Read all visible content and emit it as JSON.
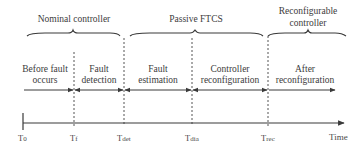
{
  "diagram": {
    "type": "timeline",
    "phases_top": [
      {
        "label": "Nominal controller",
        "from": "T0",
        "to": "Tdet"
      },
      {
        "label": "Passive FTCS",
        "from": "Tdet",
        "to": "Trec"
      },
      {
        "label_line1": "Reconfigurable",
        "label_line2": "controller",
        "from": "Trec",
        "to": "end"
      }
    ],
    "stages": [
      {
        "line1": "Before fault",
        "line2": "occurs"
      },
      {
        "line1": "Fault",
        "line2": "detection"
      },
      {
        "line1": "Fault",
        "line2": "estimation"
      },
      {
        "line1": "Controller",
        "line2": "reconfiguration"
      },
      {
        "line1": "After",
        "line2": "reconfiguration"
      }
    ],
    "axis": {
      "ticks": [
        "T0",
        "Tf",
        "Tdet",
        "Tdia",
        "Trec"
      ],
      "tick_display": [
        {
          "main": "T",
          "sub": "0"
        },
        {
          "main": "T",
          "sub": "f"
        },
        {
          "main": "T",
          "sub": "det"
        },
        {
          "main": "T",
          "sub": "dia"
        },
        {
          "main": "T",
          "sub": "rec"
        }
      ],
      "label": "Time"
    },
    "colors": {
      "line": "#3a3a3a",
      "dashed": "#555555",
      "text": "#3c3c3c",
      "background": "#ffffff"
    }
  }
}
